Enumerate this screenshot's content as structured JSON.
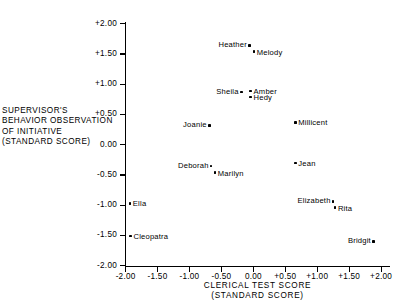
{
  "chart_data": {
    "type": "scatter",
    "title": "",
    "xlabel": "CLERICAL TEST SCORE (STANDARD SCORE)",
    "ylabel": "SUPERVISOR'S BEHAVIOR OBSERVATION OF INITIATIVE (STANDARD SCORE)",
    "xlim": [
      -2.0,
      2.0
    ],
    "ylim": [
      -2.0,
      2.0
    ],
    "grid": false,
    "legend": "none",
    "xticks": [
      "-2.00",
      "-1.50",
      "-1.00",
      "-0.50",
      "0.00",
      "+0.50",
      "+1.00",
      "+1.50",
      "+2.00"
    ],
    "yticks": [
      "-2.00",
      "-1.50",
      "-1.00",
      "-0.50",
      "0.00",
      "+0.50",
      "+1.00",
      "+1.50",
      "+2.00"
    ],
    "xtick_values": [
      -2.0,
      -1.5,
      -1.0,
      -0.5,
      0.0,
      0.5,
      1.0,
      1.5,
      2.0
    ],
    "ytick_values": [
      -2.0,
      -1.5,
      -1.0,
      -0.5,
      0.0,
      0.5,
      1.0,
      1.5,
      2.0
    ],
    "points": [
      {
        "label": "Heather",
        "x": -0.06,
        "y": 1.64,
        "label_side": "left"
      },
      {
        "label": "Melody",
        "x": 0.01,
        "y": 1.54,
        "label_side": "right"
      },
      {
        "label": "Sheila",
        "x": -0.19,
        "y": 0.87,
        "label_side": "left"
      },
      {
        "label": "Amber",
        "x": -0.04,
        "y": 0.89,
        "label_side": "right"
      },
      {
        "label": "Hedy",
        "x": -0.04,
        "y": 0.79,
        "label_side": "right"
      },
      {
        "label": "Joanie",
        "x": -0.69,
        "y": 0.32,
        "label_side": "left"
      },
      {
        "label": "Millicent",
        "x": 0.66,
        "y": 0.37,
        "label_side": "right"
      },
      {
        "label": "Deborah",
        "x": -0.66,
        "y": -0.35,
        "label_side": "left"
      },
      {
        "label": "Marilyn",
        "x": -0.6,
        "y": -0.46,
        "label_side": "right"
      },
      {
        "label": "Jean",
        "x": 0.66,
        "y": -0.3,
        "label_side": "right"
      },
      {
        "label": "Elizabeth",
        "x": 1.25,
        "y": -0.94,
        "label_side": "left"
      },
      {
        "label": "Rita",
        "x": 1.28,
        "y": -1.04,
        "label_side": "right"
      },
      {
        "label": "Ella",
        "x": -1.93,
        "y": -0.97,
        "label_side": "right"
      },
      {
        "label": "Cleopatra",
        "x": -1.92,
        "y": -1.51,
        "label_side": "right"
      },
      {
        "label": "Bridgit",
        "x": 1.88,
        "y": -1.6,
        "label_side": "left"
      }
    ]
  },
  "axis_titles": {
    "y_lines": [
      "SUPERVISOR'S",
      "BEHAVIOR OBSERVATION",
      "OF INITIATIVE",
      "(STANDARD SCORE)"
    ],
    "x_lines": [
      "CLERICAL TEST SCORE",
      "(STANDARD SCORE)"
    ]
  }
}
